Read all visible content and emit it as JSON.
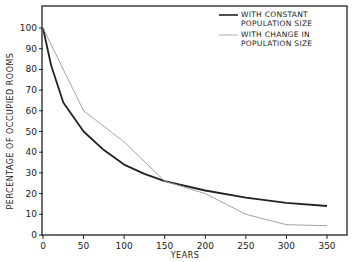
{
  "chart_data": {
    "type": "line",
    "title": "",
    "xlabel": "YEARS",
    "ylabel": "PERCENTAGE OF OCCUPIED ROOMS",
    "xlim": [
      0,
      370
    ],
    "ylim": [
      0,
      107
    ],
    "x_ticks": [
      0,
      50,
      100,
      150,
      200,
      250,
      300,
      350
    ],
    "y_ticks": [
      0,
      10,
      20,
      30,
      40,
      50,
      60,
      70,
      80,
      90,
      100
    ],
    "grid": false,
    "legend_position": "upper right",
    "series": [
      {
        "name": "WITH CONSTANT POPULATION SIZE",
        "style": "thick dark",
        "color": "#222222",
        "x": [
          0,
          10,
          25,
          50,
          75,
          100,
          125,
          150,
          200,
          250,
          300,
          350
        ],
        "y": [
          100,
          82,
          64,
          50,
          41,
          34,
          29.5,
          26,
          21.5,
          18,
          15.5,
          14
        ]
      },
      {
        "name": "WITH CHANGE IN POPULATION SIZE",
        "style": "thin light",
        "color": "#9a9a9a",
        "x": [
          0,
          50,
          100,
          150,
          200,
          250,
          300,
          350
        ],
        "y": [
          100,
          60,
          45,
          26,
          20,
          10,
          5,
          4.5
        ]
      }
    ]
  }
}
